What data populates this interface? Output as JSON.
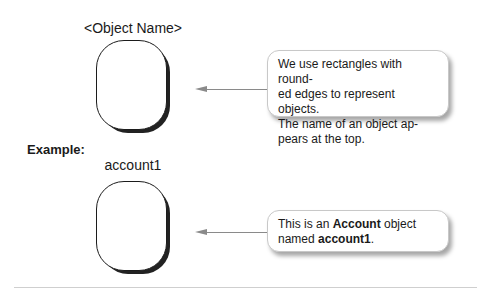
{
  "top_section": {
    "object_label": "<Object Name>",
    "callout_lines": [
      "We use rectangles with round-",
      "ed edges to represent objects.",
      "The name of an object ap-",
      "pears at the top."
    ]
  },
  "example_section": {
    "heading": "Example:",
    "object_label": "account1",
    "callout": {
      "part1": "This is an ",
      "bold1": "Account",
      "part2": " object",
      "part3": "named ",
      "bold2": "account1",
      "part4": "."
    }
  }
}
